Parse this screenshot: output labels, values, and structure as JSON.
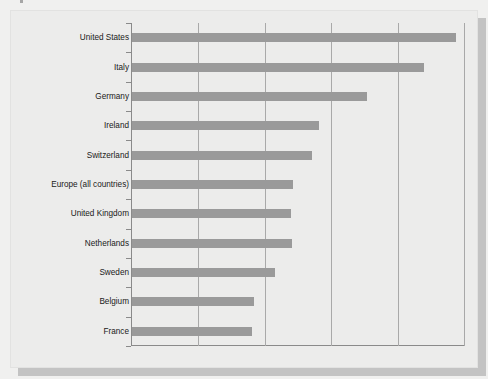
{
  "chart_data": {
    "type": "bar",
    "orientation": "horizontal",
    "title": "",
    "subtitle": "",
    "xlabel": "",
    "ylabel": "",
    "categories": [
      "United States",
      "Italy",
      "Germany",
      "Ireland",
      "Switzerland",
      "Europe (all countries)",
      "United Kingdom",
      "Netherlands",
      "Sweden",
      "Belgium",
      "France"
    ],
    "values": [
      4.85,
      4.37,
      3.52,
      2.8,
      2.69,
      2.41,
      2.38,
      2.4,
      2.14,
      1.83,
      1.8
    ],
    "xlim": [
      0,
      5
    ],
    "xticks": [
      0,
      1,
      2,
      3,
      4,
      5
    ],
    "xticklabels": [
      "",
      "",
      "",
      "",
      "",
      ""
    ],
    "grid": "vertical",
    "legend": "none",
    "series": [
      {
        "name": "",
        "values": [
          4.85,
          4.37,
          3.52,
          2.8,
          2.69,
          2.41,
          2.38,
          2.4,
          2.14,
          1.83,
          1.8
        ]
      }
    ],
    "bar_color": "#9a9a9a",
    "annotations": []
  },
  "style": {
    "page_background": "#f0f0ef",
    "panel_background": "#ececeb",
    "axis_color": "#8a8a8a",
    "gridline_color": "#a9a9a9",
    "label_color": "#202020"
  }
}
